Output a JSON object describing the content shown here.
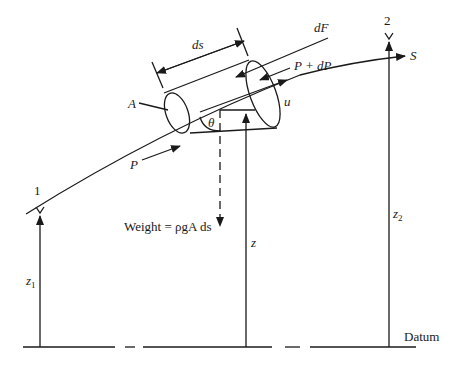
{
  "diagram": {
    "type": "fluid element on streamline (Bernoulli derivation)",
    "labels": {
      "ds": "ds",
      "dF": "dF",
      "p_plus_dp": "P + dP",
      "s": "S",
      "area": "A",
      "u": "u",
      "theta": "θ",
      "p": "P",
      "weight": "Weight = ρgA ds",
      "point1": "1",
      "point2": "2",
      "z": "z",
      "z1": "z",
      "z1_sub": "1",
      "z2": "z",
      "z2_sub": "2",
      "datum": "Datum"
    },
    "colors": {
      "ink": "#1a1a1a",
      "background": "#ffffff"
    }
  }
}
